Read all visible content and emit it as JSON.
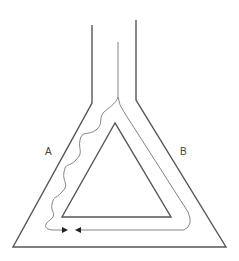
{
  "diagram": {
    "title": "",
    "labels": {
      "left_branch": "A",
      "right_branch": "B"
    },
    "colors": {
      "stroke": "#555555",
      "path": "#777777",
      "background": "#ffffff"
    },
    "elements": [
      "outer-funnel-triangle",
      "inner-triangle",
      "wavy-path-branch-A",
      "smooth-path-branch-B",
      "arrowheads-meeting-at-bottom"
    ]
  }
}
